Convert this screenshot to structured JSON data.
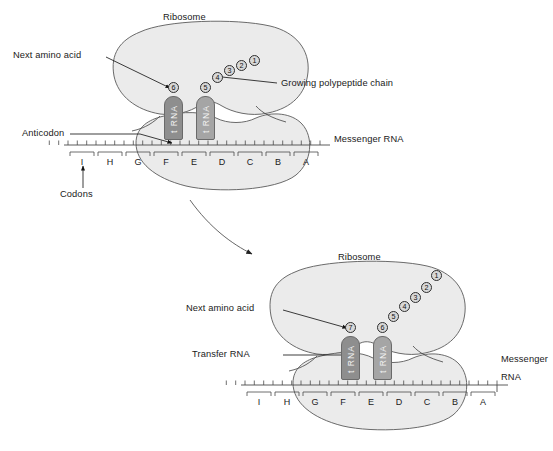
{
  "figure": {
    "type": "biology-diagram"
  },
  "panels": [
    {
      "id": "top-panel",
      "labels": {
        "ribosome": "Ribosome",
        "next_amino_acid": "Next amino acid",
        "growing_chain": "Growing polypeptide chain",
        "anticodon": "Anticodon",
        "codons": "Codons",
        "messenger_rna": "Messenger RNA"
      },
      "codons": [
        "I",
        "H",
        "G",
        "F",
        "E",
        "D",
        "C",
        "B",
        "A"
      ],
      "trna": [
        {
          "label": "t RNA",
          "codon": "F",
          "amino_acid": "6"
        },
        {
          "label": "t RNA",
          "codon": "E",
          "amino_acid": "5"
        }
      ],
      "amino_acid_chain": [
        "1",
        "2",
        "3",
        "4",
        "5"
      ],
      "next_amino_acid_number": "6"
    },
    {
      "id": "bottom-panel",
      "labels": {
        "ribosome": "Ribosome",
        "next_amino_acid": "Next amino acid",
        "transfer_rna": "Transfer RNA",
        "messenger_rna_line1": "Messenger",
        "messenger_rna_line2": "RNA"
      },
      "codons": [
        "I",
        "H",
        "G",
        "F",
        "E",
        "D",
        "C",
        "B",
        "A"
      ],
      "trna": [
        {
          "label": "t RNA",
          "codon": "G",
          "amino_acid": "7"
        },
        {
          "label": "t RNA",
          "codon": "F",
          "amino_acid": "6"
        }
      ],
      "amino_acid_chain": [
        "1",
        "2",
        "3",
        "4",
        "5",
        "6"
      ],
      "next_amino_acid_number": "7"
    }
  ],
  "colors": {
    "ribosome_fill": "#ebebeb",
    "ribosome_stroke": "#5a5a5a",
    "trna_fill": "#8e8e8e",
    "trna_fill_light": "#a5a5a5",
    "amino_acid_fill": "#d8d8d8",
    "line": "#4a4a4a",
    "text": "#1a1a1a",
    "background": "#ffffff"
  }
}
